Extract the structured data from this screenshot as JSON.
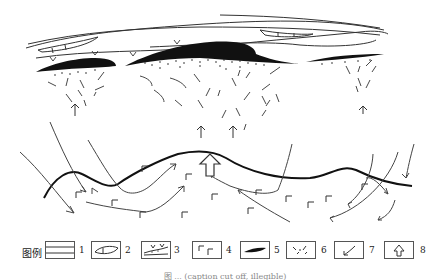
{
  "diagram": {
    "type": "geological cross-section schematic (mineralization model)",
    "elements": [
      "upper layered strata (legend 1)",
      "lens bodies in strata (legend 2)",
      "sedimentary unit with v marks and dots (legend 3)",
      "black ore bodies (legend 5): left, central large, right",
      "dashed alteration zones (legend 6) fanning upward",
      "small upward arrows under ore bodies",
      "undulating thick contact line",
      "fluid flow curved arrows (legend 7)",
      "volcanic rock symbols (legend 4)",
      "large hollow upward arrow (legend 8)"
    ]
  },
  "legend": {
    "title": "图例",
    "items": [
      {
        "num": "1",
        "symbol": "stratified-layers"
      },
      {
        "num": "2",
        "symbol": "lens-body"
      },
      {
        "num": "3",
        "symbol": "v-marks-with-dots"
      },
      {
        "num": "4",
        "symbol": "volcanic-rock-corner-marks"
      },
      {
        "num": "5",
        "symbol": "black-ore-body"
      },
      {
        "num": "6",
        "symbol": "dashed-alteration"
      },
      {
        "num": "7",
        "symbol": "curved-flow-arrow"
      },
      {
        "num": "8",
        "symbol": "hollow-up-arrow"
      }
    ]
  },
  "caption": {
    "text": "图 ... (caption cut off, illegible)"
  }
}
